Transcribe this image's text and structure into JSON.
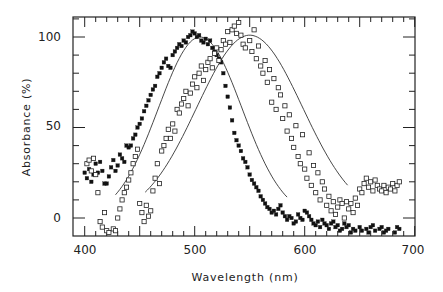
{
  "chart_data": {
    "type": "scatter",
    "title": "",
    "xlabel": "Wavelength (nm)",
    "ylabel": "Absorbance (%)",
    "xlim": [
      390,
      700
    ],
    "ylim": [
      -10,
      110
    ],
    "xticks": [
      400,
      500,
      600,
      700
    ],
    "yticks": [
      0,
      50,
      100
    ],
    "grid": false,
    "legend": null,
    "series": [
      {
        "name": "filled squares",
        "marker": "filled-square",
        "points": [
          [
            400,
            25
          ],
          [
            402,
            22
          ],
          [
            404,
            27
          ],
          [
            406,
            20
          ],
          [
            408,
            24
          ],
          [
            410,
            30
          ],
          [
            412,
            25
          ],
          [
            414,
            31
          ],
          [
            416,
            26
          ],
          [
            418,
            19
          ],
          [
            420,
            19
          ],
          [
            422,
            23
          ],
          [
            424,
            28
          ],
          [
            426,
            32
          ],
          [
            428,
            26
          ],
          [
            430,
            29
          ],
          [
            432,
            35
          ],
          [
            434,
            33
          ],
          [
            436,
            31
          ],
          [
            438,
            40
          ],
          [
            440,
            39
          ],
          [
            442,
            40
          ],
          [
            444,
            44
          ],
          [
            446,
            46
          ],
          [
            448,
            50
          ],
          [
            450,
            52
          ],
          [
            452,
            55
          ],
          [
            454,
            59
          ],
          [
            456,
            62
          ],
          [
            458,
            65
          ],
          [
            460,
            68
          ],
          [
            462,
            71
          ],
          [
            464,
            73
          ],
          [
            466,
            78
          ],
          [
            468,
            80
          ],
          [
            470,
            83
          ],
          [
            472,
            86
          ],
          [
            474,
            88
          ],
          [
            476,
            84
          ],
          [
            478,
            83
          ],
          [
            480,
            90
          ],
          [
            482,
            92
          ],
          [
            484,
            94
          ],
          [
            486,
            96
          ],
          [
            488,
            95
          ],
          [
            490,
            98
          ],
          [
            492,
            97
          ],
          [
            494,
            100
          ],
          [
            496,
            101
          ],
          [
            498,
            103
          ],
          [
            500,
            102
          ],
          [
            502,
            100
          ],
          [
            504,
            101
          ],
          [
            506,
            98
          ],
          [
            508,
            97
          ],
          [
            510,
            99
          ],
          [
            512,
            96
          ],
          [
            514,
            98
          ],
          [
            516,
            94
          ],
          [
            518,
            92
          ],
          [
            520,
            90
          ],
          [
            522,
            88
          ],
          [
            524,
            86
          ],
          [
            526,
            80
          ],
          [
            528,
            73
          ],
          [
            530,
            67
          ],
          [
            532,
            61
          ],
          [
            534,
            54
          ],
          [
            536,
            47
          ],
          [
            538,
            43
          ],
          [
            540,
            40
          ],
          [
            542,
            37
          ],
          [
            544,
            33
          ],
          [
            546,
            31
          ],
          [
            548,
            28
          ],
          [
            550,
            24
          ],
          [
            552,
            21
          ],
          [
            554,
            19
          ],
          [
            556,
            17
          ],
          [
            558,
            15
          ],
          [
            560,
            12
          ],
          [
            562,
            10
          ],
          [
            564,
            8
          ],
          [
            566,
            6
          ],
          [
            568,
            5
          ],
          [
            570,
            3
          ],
          [
            572,
            4
          ],
          [
            574,
            2
          ],
          [
            576,
            5
          ],
          [
            578,
            7
          ],
          [
            580,
            3
          ],
          [
            582,
            1
          ],
          [
            584,
            -1
          ],
          [
            586,
            1
          ],
          [
            588,
            0
          ],
          [
            590,
            -3
          ],
          [
            592,
            -2
          ],
          [
            594,
            2
          ],
          [
            596,
            0
          ],
          [
            598,
            -1
          ],
          [
            600,
            4
          ],
          [
            602,
            3
          ],
          [
            604,
            1
          ],
          [
            606,
            -1
          ],
          [
            608,
            -3
          ],
          [
            610,
            -4
          ],
          [
            612,
            -2
          ],
          [
            614,
            -5
          ],
          [
            616,
            -1
          ],
          [
            618,
            -3
          ],
          [
            620,
            -4
          ],
          [
            622,
            -6
          ],
          [
            624,
            -3
          ],
          [
            626,
            -2
          ],
          [
            628,
            -5
          ],
          [
            630,
            -4
          ],
          [
            632,
            -7
          ],
          [
            634,
            -6
          ],
          [
            636,
            -3
          ],
          [
            638,
            -5
          ],
          [
            640,
            -4
          ],
          [
            642,
            -8
          ],
          [
            644,
            -6
          ],
          [
            646,
            -7
          ],
          [
            648,
            -9
          ],
          [
            650,
            -5
          ],
          [
            652,
            -7
          ],
          [
            654,
            -10
          ],
          [
            656,
            -6
          ],
          [
            658,
            -8
          ],
          [
            660,
            -5
          ],
          [
            662,
            -4
          ],
          [
            664,
            -7
          ],
          [
            666,
            -9
          ],
          [
            668,
            -6
          ],
          [
            670,
            -5
          ],
          [
            672,
            -8
          ],
          [
            674,
            -7
          ],
          [
            676,
            -6
          ],
          [
            678,
            -9
          ],
          [
            680,
            -10
          ],
          [
            682,
            -8
          ],
          [
            684,
            -5
          ],
          [
            686,
            -6
          ]
        ]
      },
      {
        "name": "open squares",
        "marker": "open-square",
        "points": [
          [
            402,
            30
          ],
          [
            404,
            32
          ],
          [
            406,
            26
          ],
          [
            408,
            33
          ],
          [
            410,
            24
          ],
          [
            412,
            14
          ],
          [
            414,
            -2
          ],
          [
            416,
            -5
          ],
          [
            418,
            3
          ],
          [
            420,
            -7
          ],
          [
            422,
            -8
          ],
          [
            424,
            -9
          ],
          [
            426,
            -6
          ],
          [
            428,
            -7
          ],
          [
            430,
            0
          ],
          [
            432,
            5
          ],
          [
            434,
            10
          ],
          [
            436,
            14
          ],
          [
            438,
            17
          ],
          [
            440,
            21
          ],
          [
            442,
            25
          ],
          [
            444,
            30
          ],
          [
            446,
            34
          ],
          [
            448,
            38
          ],
          [
            450,
            8
          ],
          [
            452,
            3
          ],
          [
            454,
            -2
          ],
          [
            456,
            7
          ],
          [
            458,
            1
          ],
          [
            460,
            4
          ],
          [
            462,
            15
          ],
          [
            464,
            22
          ],
          [
            466,
            30
          ],
          [
            468,
            19
          ],
          [
            470,
            37
          ],
          [
            472,
            40
          ],
          [
            474,
            44
          ],
          [
            476,
            49
          ],
          [
            478,
            44
          ],
          [
            480,
            52
          ],
          [
            482,
            48
          ],
          [
            484,
            60
          ],
          [
            486,
            58
          ],
          [
            488,
            63
          ],
          [
            490,
            66
          ],
          [
            492,
            70
          ],
          [
            494,
            62
          ],
          [
            496,
            69
          ],
          [
            498,
            74
          ],
          [
            500,
            78
          ],
          [
            502,
            72
          ],
          [
            504,
            80
          ],
          [
            506,
            84
          ],
          [
            508,
            76
          ],
          [
            510,
            82
          ],
          [
            512,
            86
          ],
          [
            514,
            88
          ],
          [
            516,
            83
          ],
          [
            518,
            91
          ],
          [
            520,
            94
          ],
          [
            522,
            87
          ],
          [
            524,
            93
          ],
          [
            526,
            98
          ],
          [
            528,
            96
          ],
          [
            530,
            103
          ],
          [
            532,
            97
          ],
          [
            534,
            104
          ],
          [
            536,
            106
          ],
          [
            538,
            102
          ],
          [
            540,
            108
          ],
          [
            542,
            101
          ],
          [
            544,
            96
          ],
          [
            546,
            94
          ],
          [
            548,
            110
          ],
          [
            550,
            98
          ],
          [
            552,
            92
          ],
          [
            554,
            104
          ],
          [
            556,
            88
          ],
          [
            558,
            95
          ],
          [
            560,
            84
          ],
          [
            562,
            80
          ],
          [
            564,
            87
          ],
          [
            566,
            75
          ],
          [
            568,
            82
          ],
          [
            570,
            64
          ],
          [
            572,
            77
          ],
          [
            574,
            60
          ],
          [
            576,
            72
          ],
          [
            578,
            68
          ],
          [
            580,
            55
          ],
          [
            582,
            62
          ],
          [
            584,
            48
          ],
          [
            586,
            57
          ],
          [
            588,
            44
          ],
          [
            590,
            39
          ],
          [
            592,
            51
          ],
          [
            594,
            34
          ],
          [
            596,
            30
          ],
          [
            598,
            46
          ],
          [
            600,
            27
          ],
          [
            602,
            22
          ],
          [
            604,
            36
          ],
          [
            606,
            18
          ],
          [
            608,
            29
          ],
          [
            610,
            14
          ],
          [
            612,
            25
          ],
          [
            614,
            10
          ],
          [
            616,
            20
          ],
          [
            618,
            16
          ],
          [
            620,
            7
          ],
          [
            622,
            12
          ],
          [
            624,
            4
          ],
          [
            626,
            9
          ],
          [
            628,
            2
          ],
          [
            630,
            6
          ],
          [
            632,
            10
          ],
          [
            634,
            8
          ],
          [
            636,
            0
          ],
          [
            638,
            9
          ],
          [
            640,
            5
          ],
          [
            642,
            8
          ],
          [
            644,
            3
          ],
          [
            646,
            11
          ],
          [
            648,
            7
          ],
          [
            650,
            16
          ],
          [
            652,
            14
          ],
          [
            654,
            19
          ],
          [
            656,
            22
          ],
          [
            658,
            17
          ],
          [
            660,
            20
          ],
          [
            662,
            15
          ],
          [
            664,
            21
          ],
          [
            666,
            18
          ],
          [
            668,
            16
          ],
          [
            670,
            15
          ],
          [
            672,
            18
          ],
          [
            674,
            14
          ],
          [
            676,
            17
          ],
          [
            678,
            16
          ],
          [
            680,
            19
          ],
          [
            682,
            15
          ],
          [
            684,
            18
          ],
          [
            686,
            20
          ]
        ]
      }
    ],
    "fit_curves": [
      {
        "name": "fit to filled squares",
        "peak_nm": 505,
        "range": [
          430,
          585
        ]
      },
      {
        "name": "fit to open squares",
        "peak_nm": 550,
        "range": [
          455,
          640
        ]
      }
    ]
  },
  "axes": {
    "x_label": "Wavelength (nm)",
    "y_label": "Absorbance (%)",
    "x_tick_labels": [
      "400",
      "500",
      "600",
      "700"
    ],
    "y_tick_labels": [
      "100",
      "50",
      "0"
    ]
  }
}
